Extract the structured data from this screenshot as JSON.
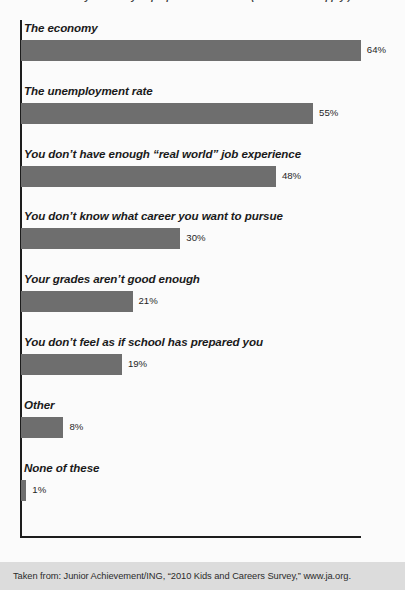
{
  "figure": {
    "title_partial": "worried about your ability to prepare for a career? (Select all that apply.)",
    "source_note": "Taken from: Junior Achievement/ING, “2010 Kids and Careers Survey,” www.ja.org."
  },
  "chart_data": {
    "type": "bar",
    "orientation": "horizontal",
    "title": "",
    "xlabel": "",
    "ylabel": "",
    "xlim": [
      0,
      64
    ],
    "grid": false,
    "legend": false,
    "bar_color": "#6e6e6e",
    "axis_color": "#1d1d1d",
    "categories": [
      "The economy",
      "The unemployment rate",
      "You don’t have enough “real world” job experience",
      "You don’t know what career you want to pursue",
      "Your grades aren’t good enough",
      "You don’t feel as if school has prepared you",
      "Other",
      "None of these"
    ],
    "values": [
      64,
      55,
      48,
      30,
      21,
      19,
      8,
      1
    ],
    "value_labels": [
      "64%",
      "55%",
      "48%",
      "30%",
      "21%",
      "19%",
      "8%",
      "1%"
    ]
  }
}
